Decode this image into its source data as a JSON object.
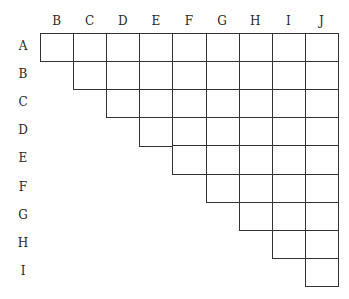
{
  "diagram": {
    "type": "upper-triangular pairwise comparison grid",
    "column_labels": [
      "B",
      "C",
      "D",
      "E",
      "F",
      "G",
      "H",
      "I",
      "J"
    ],
    "row_labels": [
      "A",
      "B",
      "C",
      "D",
      "E",
      "F",
      "G",
      "H",
      "I"
    ],
    "line_color": "#333333"
  }
}
